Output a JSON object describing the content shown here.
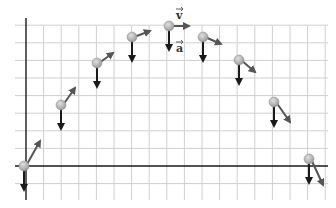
{
  "diagram": {
    "labels": {
      "velocity": "v",
      "acceleration": "a"
    },
    "colors": {
      "background": "#ffffff",
      "grid": "#cfcfcf",
      "axis": "#1a1a1a",
      "ball": "#b3b3b3",
      "ball_highlight": "#e0e0e0",
      "velocity_arrow": "#555555",
      "acceleration_arrow": "#1a1a1a"
    },
    "grid": {
      "x_start": 15,
      "x_end": 328,
      "y_start": 18,
      "y_end": 200,
      "axis_x": 26,
      "axis_y": 166,
      "spacing": 17.6
    },
    "points": [
      {
        "x": 24,
        "y": 166,
        "vx": 16,
        "vy": -25
      },
      {
        "x": 61,
        "y": 105,
        "vx": 14,
        "vy": -17
      },
      {
        "x": 97,
        "y": 63,
        "vx": 16,
        "vy": -10
      },
      {
        "x": 132,
        "y": 37,
        "vx": 18,
        "vy": -6
      },
      {
        "x": 169,
        "y": 26,
        "vx": 20,
        "vy": 0
      },
      {
        "x": 203,
        "y": 37,
        "vx": 18,
        "vy": 7
      },
      {
        "x": 239,
        "y": 60,
        "vx": 16,
        "vy": 12
      },
      {
        "x": 274,
        "y": 102,
        "vx": 16,
        "vy": 20
      },
      {
        "x": 309,
        "y": 159,
        "vx": 14,
        "vy": 26
      }
    ],
    "acceleration_length": 24
  }
}
